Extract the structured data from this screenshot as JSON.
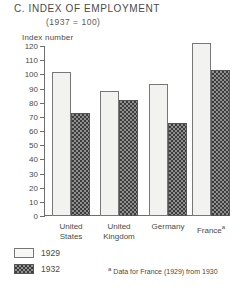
{
  "chart_data": {
    "type": "bar",
    "title": "C. INDEX OF EMPLOYMENT",
    "subtitle": "(1937 = 100)",
    "ylabel": "Index number",
    "xlabel": "",
    "ylim": [
      0,
      120
    ],
    "ytick_step": 10,
    "yticks": [
      "120",
      "110",
      "100",
      "90",
      "80",
      "70",
      "60",
      "50",
      "40",
      "30",
      "20",
      "10",
      "0"
    ],
    "grid": false,
    "legend_position": "bottom-left",
    "categories": [
      "United States",
      "United Kingdom",
      "Germany",
      "France"
    ],
    "category_lines": [
      [
        "United",
        "States"
      ],
      [
        "United",
        "Kingdom"
      ],
      [
        "Germany",
        ""
      ],
      [
        "France",
        ""
      ]
    ],
    "category_footnote_marker": [
      "",
      "",
      "",
      "a"
    ],
    "series": [
      {
        "name": "1929",
        "values": [
          102,
          88,
          93,
          122
        ],
        "style": "light"
      },
      {
        "name": "1932",
        "values": [
          73,
          82,
          66,
          103
        ],
        "style": "dark-checker"
      }
    ],
    "footnote": "Data for France (1929) from 1930",
    "footnote_marker": "a",
    "colors": {
      "series_1929_fill": "#f2f2f0",
      "series_1929_border": "#777777",
      "series_1932_fill": "#8f8f8f",
      "series_1932_pattern": "#3c3c3c",
      "axis": "#6e6e6e",
      "text": "#4a4a4a",
      "background": "#ffffff"
    }
  }
}
